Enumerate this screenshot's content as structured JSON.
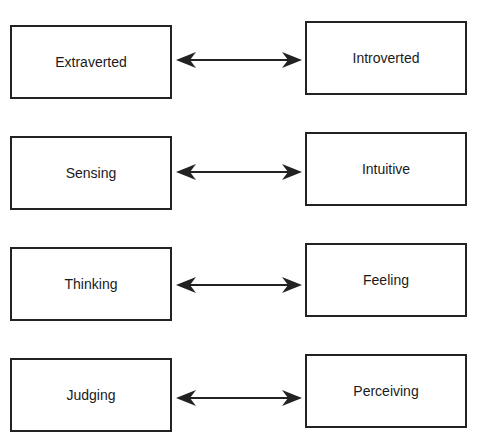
{
  "diagram": {
    "title": "",
    "pairs": [
      {
        "left": "Extraverted",
        "right": "Introverted"
      },
      {
        "left": "Sensing",
        "right": "Intuitive"
      },
      {
        "left": "Thinking",
        "right": "Feeling"
      },
      {
        "left": "Judging",
        "right": "Perceiving"
      }
    ],
    "connector": "double-headed-arrow",
    "colors": {
      "stroke": "#222222",
      "background": "#ffffff"
    }
  }
}
